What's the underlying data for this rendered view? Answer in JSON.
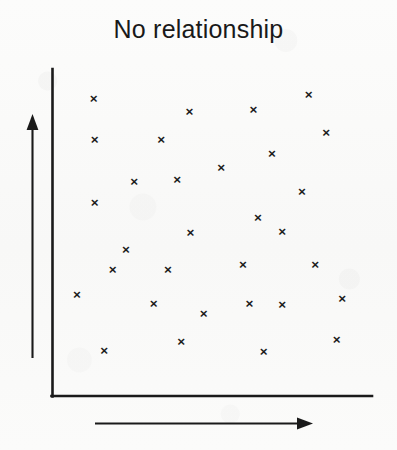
{
  "title": "No relationship",
  "axes": {
    "y_axis_name": "vertical-axis-line",
    "x_axis_name": "horizontal-axis-line",
    "y_arrow_name": "y-axis-direction-arrow",
    "x_arrow_name": "x-axis-direction-arrow",
    "marker_glyph": "×",
    "line_color": "#1a1a1a"
  },
  "chart_data": {
    "type": "scatter",
    "title": "No relationship",
    "xlabel": "",
    "ylabel": "",
    "xlim": [
      0,
      100
    ],
    "ylim": [
      0,
      100
    ],
    "grid": false,
    "legend": null,
    "axis_tick_labels": {
      "x": [],
      "y": []
    },
    "annotations": [],
    "marker": "x",
    "marker_color": "#1c1c1c",
    "series": [
      {
        "name": "observations",
        "points": [
          {
            "x": 10.6,
            "y": 94.0
          },
          {
            "x": 82.2,
            "y": 95.4
          },
          {
            "x": 42.5,
            "y": 89.9
          },
          {
            "x": 63.8,
            "y": 90.5
          },
          {
            "x": 10.9,
            "y": 80.7
          },
          {
            "x": 33.1,
            "y": 80.7
          },
          {
            "x": 88.1,
            "y": 83.1
          },
          {
            "x": 70.0,
            "y": 76.1
          },
          {
            "x": 53.1,
            "y": 71.5
          },
          {
            "x": 38.4,
            "y": 67.8
          },
          {
            "x": 24.1,
            "y": 66.9
          },
          {
            "x": 80.0,
            "y": 63.8
          },
          {
            "x": 10.9,
            "y": 60.1
          },
          {
            "x": 65.3,
            "y": 55.2
          },
          {
            "x": 73.4,
            "y": 50.9
          },
          {
            "x": 42.8,
            "y": 50.6
          },
          {
            "x": 21.3,
            "y": 45.1
          },
          {
            "x": 16.9,
            "y": 38.5
          },
          {
            "x": 35.3,
            "y": 38.5
          },
          {
            "x": 60.3,
            "y": 40.0
          },
          {
            "x": 84.4,
            "y": 40.0
          },
          {
            "x": 5.0,
            "y": 30.4
          },
          {
            "x": 30.6,
            "y": 27.3
          },
          {
            "x": 47.2,
            "y": 24.2
          },
          {
            "x": 62.5,
            "y": 27.3
          },
          {
            "x": 73.4,
            "y": 27.0
          },
          {
            "x": 93.4,
            "y": 29.2
          },
          {
            "x": 14.1,
            "y": 12.3
          },
          {
            "x": 39.7,
            "y": 15.0
          },
          {
            "x": 67.2,
            "y": 12.0
          },
          {
            "x": 91.6,
            "y": 15.6
          }
        ]
      }
    ]
  }
}
